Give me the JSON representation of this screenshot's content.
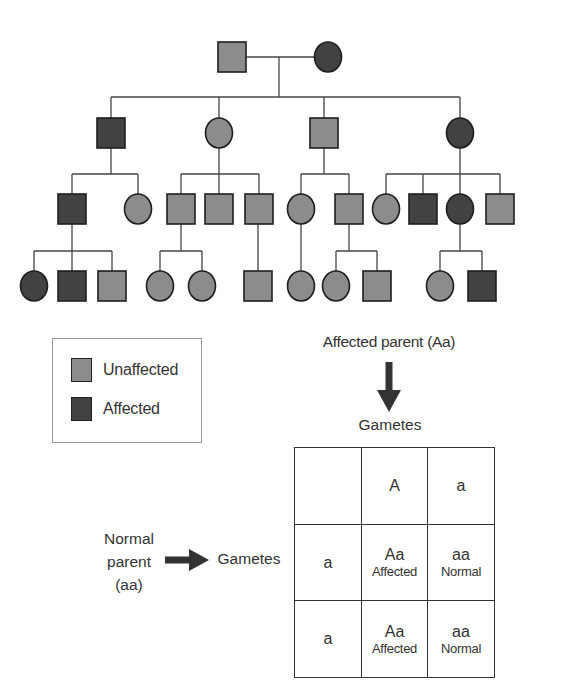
{
  "colors": {
    "unaffected": "#8c8c8c",
    "affected": "#424242",
    "stroke": "#1e1e1e",
    "line": "#444444"
  },
  "pedigree": {
    "node_size": {
      "w": 28,
      "h": 30
    },
    "nodes": [
      {
        "id": "g1-father",
        "gen": 1,
        "sex": "male",
        "status": "unaffected",
        "cx": 232,
        "cy": 57
      },
      {
        "id": "g1-mother",
        "gen": 1,
        "sex": "female",
        "status": "affected",
        "cx": 328,
        "cy": 57
      },
      {
        "id": "g2-1",
        "gen": 2,
        "sex": "male",
        "status": "affected",
        "cx": 111,
        "cy": 133
      },
      {
        "id": "g2-2",
        "gen": 2,
        "sex": "female",
        "status": "unaffected",
        "cx": 219,
        "cy": 133
      },
      {
        "id": "g2-3",
        "gen": 2,
        "sex": "male",
        "status": "unaffected",
        "cx": 324,
        "cy": 133
      },
      {
        "id": "g2-4",
        "gen": 2,
        "sex": "female",
        "status": "affected",
        "cx": 460,
        "cy": 133
      },
      {
        "id": "g3-1",
        "gen": 3,
        "sex": "male",
        "status": "affected",
        "cx": 72,
        "cy": 209
      },
      {
        "id": "g3-2",
        "gen": 3,
        "sex": "female",
        "status": "unaffected",
        "cx": 138,
        "cy": 209
      },
      {
        "id": "g3-3",
        "gen": 3,
        "sex": "male",
        "status": "unaffected",
        "cx": 181,
        "cy": 209
      },
      {
        "id": "g3-4",
        "gen": 3,
        "sex": "male",
        "status": "unaffected",
        "cx": 219,
        "cy": 209
      },
      {
        "id": "g3-5",
        "gen": 3,
        "sex": "male",
        "status": "unaffected",
        "cx": 259,
        "cy": 209
      },
      {
        "id": "g3-6",
        "gen": 3,
        "sex": "female",
        "status": "unaffected",
        "cx": 301,
        "cy": 209
      },
      {
        "id": "g3-7",
        "gen": 3,
        "sex": "male",
        "status": "unaffected",
        "cx": 349,
        "cy": 209
      },
      {
        "id": "g3-8",
        "gen": 3,
        "sex": "female",
        "status": "unaffected",
        "cx": 386,
        "cy": 209
      },
      {
        "id": "g3-9",
        "gen": 3,
        "sex": "male",
        "status": "affected",
        "cx": 423,
        "cy": 209
      },
      {
        "id": "g3-10",
        "gen": 3,
        "sex": "female",
        "status": "affected",
        "cx": 460,
        "cy": 209
      },
      {
        "id": "g3-11",
        "gen": 3,
        "sex": "male",
        "status": "unaffected",
        "cx": 500,
        "cy": 209
      },
      {
        "id": "g4-1",
        "gen": 4,
        "sex": "female",
        "status": "affected",
        "cx": 34,
        "cy": 286
      },
      {
        "id": "g4-2",
        "gen": 4,
        "sex": "male",
        "status": "affected",
        "cx": 72,
        "cy": 286
      },
      {
        "id": "g4-3",
        "gen": 4,
        "sex": "male",
        "status": "unaffected",
        "cx": 112,
        "cy": 286
      },
      {
        "id": "g4-4",
        "gen": 4,
        "sex": "female",
        "status": "unaffected",
        "cx": 160,
        "cy": 286
      },
      {
        "id": "g4-5",
        "gen": 4,
        "sex": "female",
        "status": "unaffected",
        "cx": 202,
        "cy": 286
      },
      {
        "id": "g4-6",
        "gen": 4,
        "sex": "male",
        "status": "unaffected",
        "cx": 258,
        "cy": 286
      },
      {
        "id": "g4-7",
        "gen": 4,
        "sex": "female",
        "status": "unaffected",
        "cx": 301,
        "cy": 286
      },
      {
        "id": "g4-8",
        "gen": 4,
        "sex": "female",
        "status": "unaffected",
        "cx": 336,
        "cy": 286
      },
      {
        "id": "g4-9",
        "gen": 4,
        "sex": "male",
        "status": "unaffected",
        "cx": 377,
        "cy": 286
      },
      {
        "id": "g4-10",
        "gen": 4,
        "sex": "female",
        "status": "unaffected",
        "cx": 440,
        "cy": 286
      },
      {
        "id": "g4-11",
        "gen": 4,
        "sex": "male",
        "status": "affected",
        "cx": 482,
        "cy": 286
      }
    ],
    "lines": [
      [
        246,
        57,
        314,
        57
      ],
      [
        279,
        57,
        279,
        97
      ],
      [
        111,
        97,
        460,
        97
      ],
      [
        111,
        97,
        111,
        118
      ],
      [
        219,
        97,
        219,
        118
      ],
      [
        324,
        97,
        324,
        118
      ],
      [
        460,
        97,
        460,
        118
      ],
      [
        111,
        148,
        111,
        174
      ],
      [
        72,
        174,
        138,
        174
      ],
      [
        72,
        174,
        72,
        194
      ],
      [
        138,
        174,
        138,
        194
      ],
      [
        219,
        148,
        219,
        194
      ],
      [
        181,
        174,
        259,
        174
      ],
      [
        181,
        174,
        181,
        194
      ],
      [
        259,
        174,
        259,
        194
      ],
      [
        324,
        148,
        324,
        174
      ],
      [
        301,
        174,
        349,
        174
      ],
      [
        301,
        174,
        301,
        194
      ],
      [
        349,
        174,
        349,
        194
      ],
      [
        460,
        148,
        460,
        194
      ],
      [
        386,
        174,
        500,
        174
      ],
      [
        386,
        174,
        386,
        194
      ],
      [
        423,
        174,
        423,
        194
      ],
      [
        500,
        174,
        500,
        194
      ],
      [
        72,
        224,
        72,
        271
      ],
      [
        34,
        251,
        112,
        251
      ],
      [
        34,
        251,
        34,
        271
      ],
      [
        112,
        251,
        112,
        271
      ],
      [
        181,
        224,
        181,
        251
      ],
      [
        160,
        251,
        202,
        251
      ],
      [
        160,
        251,
        160,
        271
      ],
      [
        202,
        251,
        202,
        271
      ],
      [
        258,
        224,
        258,
        271
      ],
      [
        301,
        224,
        301,
        271
      ],
      [
        349,
        224,
        349,
        251
      ],
      [
        336,
        251,
        377,
        251
      ],
      [
        336,
        251,
        336,
        271
      ],
      [
        377,
        251,
        377,
        271
      ],
      [
        460,
        224,
        460,
        251
      ],
      [
        440,
        251,
        482,
        251
      ],
      [
        440,
        251,
        440,
        271
      ],
      [
        482,
        251,
        482,
        271
      ]
    ]
  },
  "legend": {
    "items": [
      {
        "label": "Unaffected",
        "status": "unaffected"
      },
      {
        "label": "Affected",
        "status": "affected"
      }
    ]
  },
  "cross": {
    "affected_parent_label": "Affected parent (Aa)",
    "top_gametes_label": "Gametes",
    "normal_parent_label": [
      "Normal",
      "parent",
      "(aa)"
    ],
    "left_gametes_label": "Gametes"
  },
  "punnett": {
    "header": [
      "",
      "A",
      "a"
    ],
    "rows": [
      {
        "gamete": "a",
        "cells": [
          {
            "genotype": "Aa",
            "phenotype": "Affected"
          },
          {
            "genotype": "aa",
            "phenotype": "Normal"
          }
        ]
      },
      {
        "gamete": "a",
        "cells": [
          {
            "genotype": "Aa",
            "phenotype": "Affected"
          },
          {
            "genotype": "aa",
            "phenotype": "Normal"
          }
        ]
      }
    ]
  }
}
